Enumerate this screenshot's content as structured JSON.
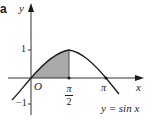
{
  "figure": {
    "panel_label": "a",
    "axes": {
      "x_label": "x",
      "y_label": "y",
      "origin_label": "O"
    },
    "ticks": {
      "y_pos": "1",
      "y_neg": "−1",
      "x_half_pi": {
        "num": "π",
        "den": "2"
      },
      "x_pi": "π"
    },
    "curve_label": "y = sin x",
    "colors": {
      "ink": "#1a1a1a",
      "shade": "#a9a9a9",
      "axis": "#333333"
    }
  }
}
